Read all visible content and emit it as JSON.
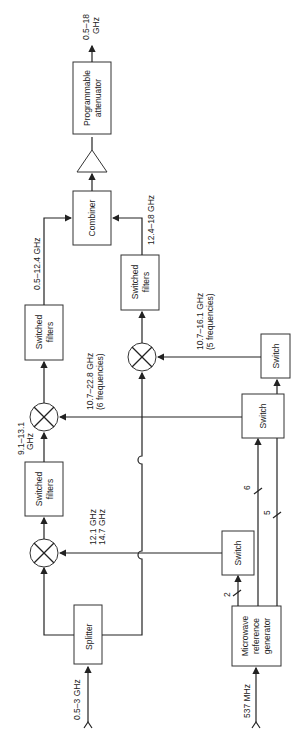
{
  "diagram": {
    "blocks": {
      "splitter": "Splitter",
      "switched_filters_1": [
        "Switched",
        "filters"
      ],
      "switched_filters_2": [
        "Switched",
        "filters"
      ],
      "switched_filters_3": [
        "Switched",
        "filters"
      ],
      "combiner": "Combiner",
      "attenuator": [
        "Programmable",
        "attenuator"
      ],
      "switch_1": "Switch",
      "switch_2": "Switch",
      "switch_3": "Switch",
      "reference_generator": [
        "Microwave",
        "reference",
        "generator"
      ]
    },
    "labels": {
      "input_rf": "0.5–3 GHz",
      "input_ref": "537 MHz",
      "output": [
        "0.5–18",
        "GHz"
      ],
      "lo1": [
        "12.1 GHz",
        "14.7 GHz"
      ],
      "if1": [
        "9.1–13.1",
        "GHz"
      ],
      "lo2": [
        "10.7–22.8 GHz",
        "(6 frequencies)"
      ],
      "band_low": "0.5–12.4 GHz",
      "lo3": [
        "10.7–16.1 GHz",
        "(5 frequencies)"
      ],
      "band_high": "12.4–18 GHz",
      "bus_2": "2",
      "bus_6": "6",
      "bus_5": "5"
    }
  }
}
